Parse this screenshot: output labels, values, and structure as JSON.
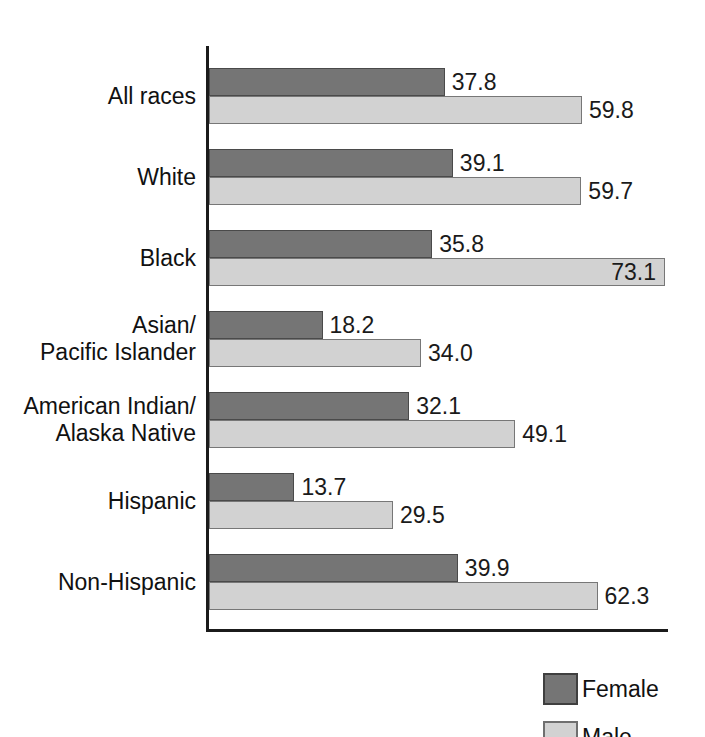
{
  "chart_data": {
    "type": "bar",
    "orientation": "horizontal",
    "title": "",
    "subtitle": "",
    "xlabel": "",
    "ylabel": "",
    "grid": false,
    "xlim": [
      0,
      74
    ],
    "legend_position": "bottom-right",
    "categories": [
      "All races",
      "White",
      "Black",
      "Asian/\nPacific Islander",
      "American Indian/\nAlaska Native",
      "Hispanic",
      "Non-Hispanic"
    ],
    "series": [
      {
        "name": "Female",
        "color": "#757575",
        "values": [
          37.8,
          39.1,
          35.8,
          18.2,
          32.1,
          13.7,
          39.9
        ],
        "value_labels": [
          "37.8",
          "39.1",
          "35.8",
          "18.2",
          "32.1",
          "13.7",
          "39.9"
        ],
        "label_placement": [
          "outside",
          "outside",
          "outside",
          "outside",
          "outside",
          "outside",
          "outside"
        ]
      },
      {
        "name": "Male",
        "color": "#d2d2d2",
        "values": [
          59.8,
          59.7,
          73.1,
          34.0,
          49.1,
          29.5,
          62.3
        ],
        "value_labels": [
          "59.8",
          "59.7",
          "73.1",
          "34.0",
          "49.1",
          "29.5",
          "62.3"
        ],
        "label_placement": [
          "outside",
          "outside",
          "inside",
          "outside",
          "outside",
          "outside",
          "outside"
        ]
      }
    ]
  },
  "legend": {
    "items": [
      {
        "label": "Female",
        "swatch": "female"
      },
      {
        "label": "Male",
        "swatch": "male"
      }
    ]
  }
}
